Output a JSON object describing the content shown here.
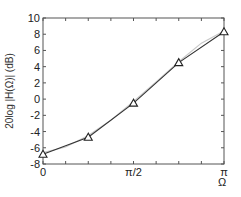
{
  "chart_data": {
    "type": "line",
    "title": "",
    "xlabel": "Ω",
    "ylabel": "20log |H(Ω)| (dB)",
    "xlim": [
      0,
      3.14159
    ],
    "ylim": [
      -8,
      10
    ],
    "grid": false,
    "legend": "none",
    "x_ticks": [
      {
        "value": 0,
        "label": "0"
      },
      {
        "value": 0.3927,
        "label": ""
      },
      {
        "value": 0.7854,
        "label": ""
      },
      {
        "value": 1.1781,
        "label": ""
      },
      {
        "value": 1.5708,
        "label": "π/2"
      },
      {
        "value": 1.9635,
        "label": ""
      },
      {
        "value": 2.3562,
        "label": ""
      },
      {
        "value": 2.7489,
        "label": ""
      },
      {
        "value": 3.14159,
        "label": "π"
      }
    ],
    "y_ticks": [
      {
        "value": 10,
        "label": "10"
      },
      {
        "value": 8,
        "label": "8"
      },
      {
        "value": 6,
        "label": "6"
      },
      {
        "value": 4,
        "label": "4"
      },
      {
        "value": 2,
        "label": "2"
      },
      {
        "value": 0,
        "label": "0"
      },
      {
        "value": -2,
        "label": "-2"
      },
      {
        "value": -4,
        "label": "-4"
      },
      {
        "value": -6,
        "label": "-6"
      },
      {
        "value": -8,
        "label": "-8"
      }
    ],
    "series": [
      {
        "name": "designed response",
        "style": "line-with-triangle-markers",
        "color": "#333333",
        "x": [
          0,
          0.7854,
          1.5708,
          2.3562,
          3.14159
        ],
        "x_labels": [
          "0",
          "π/4",
          "π/2",
          "3π/4",
          "π"
        ],
        "values": [
          -6.8,
          -4.7,
          -0.5,
          4.5,
          8.3
        ]
      },
      {
        "name": "reference",
        "style": "line",
        "color": "#c8c8c8",
        "x": [
          0,
          0.3927,
          0.7854,
          1.1781,
          1.5708,
          1.9635,
          2.3562,
          2.7489,
          3.14159
        ],
        "values": [
          -6.6,
          -5.9,
          -4.5,
          -2.6,
          -0.3,
          2.1,
          4.6,
          6.9,
          8.4
        ]
      }
    ]
  }
}
